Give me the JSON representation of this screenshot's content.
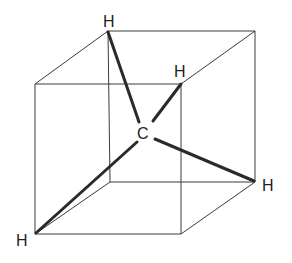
{
  "diagram": {
    "title": "",
    "atoms": {
      "center": "C",
      "h_top": "H",
      "h_upper_right": "H",
      "h_right": "H",
      "h_bottom_left": "H"
    },
    "colors": {
      "edges": "#3a3a3a",
      "bonds": "#2a2a2a",
      "labels": "#222222",
      "background": "#ffffff"
    }
  }
}
